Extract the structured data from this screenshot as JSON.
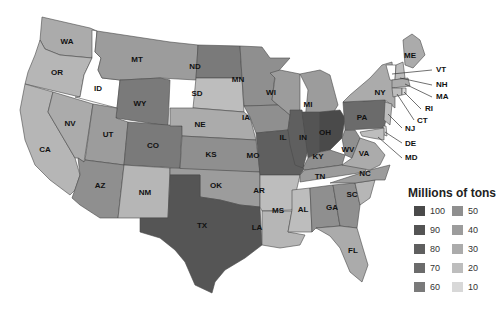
{
  "legend": {
    "title": "Millions of tons",
    "items": [
      {
        "value": "100",
        "color": "#4a4a4a"
      },
      {
        "value": "50",
        "color": "#8f8f8f"
      },
      {
        "value": "90",
        "color": "#545454"
      },
      {
        "value": "40",
        "color": "#9c9c9c"
      },
      {
        "value": "80",
        "color": "#5f5f5f"
      },
      {
        "value": "30",
        "color": "#ababab"
      },
      {
        "value": "70",
        "color": "#6b6b6b"
      },
      {
        "value": "20",
        "color": "#bdbdbd"
      },
      {
        "value": "60",
        "color": "#7a7a7a"
      },
      {
        "value": "10",
        "color": "#d8d8d8"
      }
    ]
  },
  "states": [
    {
      "abbr": "WA",
      "label_x": 67,
      "label_y": 42,
      "color": "#ababab",
      "points": "42,17 55,20 90,28 97,31 92,58 60,55 45,49 40,40"
    },
    {
      "abbr": "OR",
      "label_x": 57,
      "label_y": 73,
      "color": "#b6b6b6",
      "points": "40,40 45,49 60,55 92,58 84,75 80,97 25,84 28,72 35,55"
    },
    {
      "abbr": "ID",
      "label_x": 98,
      "label_y": 89,
      "color": "#ffffff",
      "points": "92,30 97,31 95,52 101,58 98,70 102,78 120,80 117,108 75,97 80,97 84,75 92,58"
    },
    {
      "abbr": "MT",
      "label_x": 137,
      "label_y": 60,
      "color": "#9c9c9c",
      "points": "97,31 170,42 198,45 196,80 160,78 122,80 120,80 102,78 98,70 101,58 95,52"
    },
    {
      "abbr": "WY",
      "label_x": 140,
      "label_y": 104,
      "color": "#7a7a7a",
      "points": "122,80 160,78 170,80 168,126 116,118 120,80"
    },
    {
      "abbr": "CA",
      "label_x": 45,
      "label_y": 150,
      "color": "#b6b6b6",
      "points": "25,84 53,92 48,112 75,158 80,175 75,190 70,195 50,180 35,165 25,140 20,110"
    },
    {
      "abbr": "NV",
      "label_x": 70,
      "label_y": 124,
      "color": "#ababab",
      "points": "53,92 93,104 84,162 78,158 75,158 48,112"
    },
    {
      "abbr": "UT",
      "label_x": 108,
      "label_y": 135,
      "color": "#9c9c9c",
      "points": "93,104 117,108 116,118 128,122 124,165 85,160"
    },
    {
      "abbr": "CO",
      "label_x": 153,
      "label_y": 146,
      "color": "#7a7a7a",
      "points": "128,122 182,126 180,168 124,165"
    },
    {
      "abbr": "AZ",
      "label_x": 100,
      "label_y": 186,
      "color": "#8f8f8f",
      "points": "85,160 124,165 118,218 100,218 80,205 72,198 80,175 78,158 84,162"
    },
    {
      "abbr": "NM",
      "label_x": 145,
      "label_y": 193,
      "color": "#b6b6b6",
      "points": "124,165 170,168 168,218 140,218 124,218 118,218"
    },
    {
      "abbr": "ND",
      "label_x": 195,
      "label_y": 67,
      "color": "#7a7a7a",
      "points": "198,45 240,46 242,78 196,78"
    },
    {
      "abbr": "SD",
      "label_x": 197,
      "label_y": 94,
      "color": "#bdbdbd",
      "points": "196,78 242,78 244,112 195,108 193,108"
    },
    {
      "abbr": "NE",
      "label_x": 200,
      "label_y": 125,
      "color": "#ababab",
      "points": "193,108 244,112 250,117 256,140 182,136 182,126 170,126 170,108"
    },
    {
      "abbr": "KS",
      "label_x": 211,
      "label_y": 155,
      "color": "#8f8f8f",
      "points": "182,136 256,140 260,172 180,170"
    },
    {
      "abbr": "OK",
      "label_x": 216,
      "label_y": 186,
      "color": "#9c9c9c",
      "points": "170,168 260,172 260,207 240,205 220,200 200,197 200,175 170,175"
    },
    {
      "abbr": "TX",
      "label_x": 202,
      "label_y": 226,
      "color": "#555555",
      "points": "170,175 200,175 200,197 220,200 240,205 260,207 262,245 245,258 225,270 215,282 212,293 195,285 185,262 175,250 160,238 140,232 140,218 168,218"
    },
    {
      "abbr": "MN",
      "label_x": 238,
      "label_y": 80,
      "color": "#8f8f8f",
      "points": "240,46 262,47 270,58 290,58 275,75 272,100 278,105 244,106 242,78"
    },
    {
      "abbr": "IA",
      "label_x": 246,
      "label_y": 118,
      "color": "#8f8f8f",
      "points": "244,106 278,105 290,115 288,130 256,133 250,117"
    },
    {
      "abbr": "MO",
      "label_x": 253,
      "label_y": 156,
      "color": "#5f5f5f",
      "points": "256,133 288,130 295,145 305,168 300,175 260,175"
    },
    {
      "abbr": "AR",
      "label_x": 259,
      "label_y": 191,
      "color": "#bdbdbd",
      "points": "260,175 300,175 292,210 262,211 260,207"
    },
    {
      "abbr": "LA",
      "label_x": 257,
      "label_y": 228,
      "color": "#b6b6b6",
      "points": "262,211 292,211 288,232 305,235 300,245 280,248 262,245"
    },
    {
      "abbr": "WI",
      "label_x": 271,
      "label_y": 93,
      "color": "#9c9c9c",
      "points": "270,73 280,70 300,74 300,110 290,115 278,105 272,100 275,78"
    },
    {
      "abbr": "IL",
      "label_x": 283,
      "label_y": 138,
      "color": "#5f5f5f",
      "points": "290,110 302,110 308,150 303,168 295,165 290,145 288,130 290,115"
    },
    {
      "abbr": "MI",
      "label_x": 308,
      "label_y": 105,
      "color": "#9c9c9c",
      "points": "300,74 320,70 330,75 338,105 330,118 305,120 308,90"
    },
    {
      "abbr": "IN",
      "label_x": 303,
      "label_y": 138,
      "color": "#545454",
      "points": "302,112 320,112 320,152 308,158"
    },
    {
      "abbr": "OH",
      "label_x": 325,
      "label_y": 133,
      "color": "#4a4a4a",
      "points": "320,112 340,110 345,118 342,138 330,150 320,152"
    },
    {
      "abbr": "KY",
      "label_x": 318,
      "label_y": 157,
      "color": "#8f8f8f",
      "points": "303,168 308,158 320,152 330,150 345,155 342,165 305,170"
    },
    {
      "abbr": "WV",
      "label_x": 348,
      "label_y": 150,
      "color": "#8f8f8f",
      "points": "342,138 345,130 355,130 360,138 352,158 345,155"
    },
    {
      "abbr": "TN",
      "label_x": 320,
      "label_y": 177,
      "color": "#9c9c9c",
      "points": "300,175 305,170 342,165 370,160 365,172 300,182"
    },
    {
      "abbr": "MS",
      "label_x": 278,
      "label_y": 211,
      "color": "#bdbdbd",
      "points": "292,190 310,188 312,232 300,232 288,232 292,210"
    },
    {
      "abbr": "AL",
      "label_x": 303,
      "label_y": 210,
      "color": "#8f8f8f",
      "points": "310,188 333,185 340,226 316,228 312,232"
    },
    {
      "abbr": "GA",
      "label_x": 332,
      "label_y": 208,
      "color": "#8f8f8f",
      "points": "333,185 355,183 360,205 357,228 340,226"
    },
    {
      "abbr": "FL",
      "label_x": 353,
      "label_y": 251,
      "color": "#ababab",
      "points": "316,228 340,226 357,228 362,245 368,265 362,282 350,272 340,248 330,236"
    },
    {
      "abbr": "SC",
      "label_x": 352,
      "label_y": 195,
      "color": "#b6b6b6",
      "points": "355,183 375,180 370,198 360,205"
    },
    {
      "abbr": "NC",
      "label_x": 365,
      "label_y": 174,
      "color": "#9c9c9c",
      "points": "330,183 370,170 390,165 385,180 375,180 355,183"
    },
    {
      "abbr": "VA",
      "label_x": 364,
      "label_y": 154,
      "color": "#ababab",
      "points": "342,165 352,158 360,138 375,143 385,155 380,165 370,170"
    },
    {
      "abbr": "PA",
      "label_x": 362,
      "label_y": 118,
      "color": "#6b6b6b",
      "points": "343,102 385,100 388,112 384,128 345,130"
    },
    {
      "abbr": "NY",
      "label_x": 380,
      "label_y": 93,
      "color": "#ababab",
      "points": "350,95 370,78 382,65 392,62 395,96 395,108 385,100 343,102"
    },
    {
      "abbr": "ME",
      "label_x": 410,
      "label_y": 56,
      "color": "#ababab",
      "points": "403,40 412,34 420,40 425,55 413,68 405,65"
    },
    {
      "abbr": "VT",
      "label_x": 0,
      "label_y": 0,
      "color": "#ffffff",
      "points": "386,65 396,65 395,80 390,80"
    },
    {
      "abbr": "NH",
      "label_x": 0,
      "label_y": 0,
      "color": "#bdbdbd",
      "points": "396,65 403,62 405,78 395,80"
    },
    {
      "abbr": "MA",
      "label_x": 0,
      "label_y": 0,
      "color": "#ababab",
      "points": "392,80 408,78 410,86 392,88"
    },
    {
      "abbr": "CT",
      "label_x": 0,
      "label_y": 0,
      "color": "#bdbdbd",
      "points": "392,88 402,88 402,95 393,97"
    },
    {
      "abbr": "RI",
      "label_x": 0,
      "label_y": 0,
      "color": "#d8d8d8",
      "points": "402,88 406,88 406,94 402,95"
    },
    {
      "abbr": "NJ",
      "label_x": 0,
      "label_y": 0,
      "color": "#bdbdbd",
      "points": "385,102 392,104 390,125 384,120"
    },
    {
      "abbr": "DE",
      "label_x": 0,
      "label_y": 0,
      "color": "#d8d8d8",
      "points": "383,126 386,126 387,136 384,135"
    },
    {
      "abbr": "MD",
      "label_x": 0,
      "label_y": 0,
      "color": "#bdbdbd",
      "points": "360,132 384,128 384,140 372,138 362,136"
    }
  ],
  "callouts": [
    {
      "abbr": "VT",
      "x1": 392,
      "y1": 74,
      "x2": 432,
      "y2": 70,
      "tx": 436,
      "ty": 70
    },
    {
      "abbr": "NH",
      "x1": 400,
      "y1": 78,
      "x2": 432,
      "y2": 85,
      "tx": 436,
      "ty": 85
    },
    {
      "abbr": "MA",
      "x1": 405,
      "y1": 84,
      "x2": 432,
      "y2": 97,
      "tx": 436,
      "ty": 97
    },
    {
      "abbr": "RI",
      "x1": 404,
      "y1": 92,
      "x2": 421,
      "y2": 109,
      "tx": 425,
      "ty": 109
    },
    {
      "abbr": "CT",
      "x1": 397,
      "y1": 94,
      "x2": 414,
      "y2": 120,
      "tx": 417,
      "ty": 121
    },
    {
      "abbr": "NJ",
      "x1": 388,
      "y1": 114,
      "x2": 402,
      "y2": 128,
      "tx": 405,
      "ty": 129
    },
    {
      "abbr": "DE",
      "x1": 385,
      "y1": 132,
      "x2": 402,
      "y2": 143,
      "tx": 405,
      "ty": 144
    },
    {
      "abbr": "MD",
      "x1": 378,
      "y1": 137,
      "x2": 402,
      "y2": 158,
      "tx": 405,
      "ty": 158
    }
  ]
}
